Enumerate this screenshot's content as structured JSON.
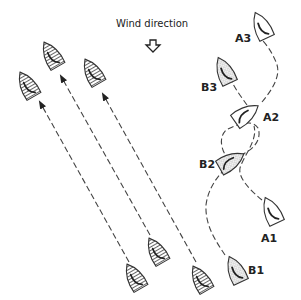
{
  "wind": {
    "label": "Wind direction",
    "arrow_icon": "down-arrow-icon"
  },
  "labels": {
    "a1": "A1",
    "a2": "A2",
    "a3": "A3",
    "b1": "B1",
    "b2": "B2",
    "b3": "B3"
  },
  "boats": {
    "hatched_count": 6,
    "white_count": 3,
    "dotted_count": 3
  },
  "colors": {
    "line": "#333333",
    "background": "#ffffff"
  }
}
